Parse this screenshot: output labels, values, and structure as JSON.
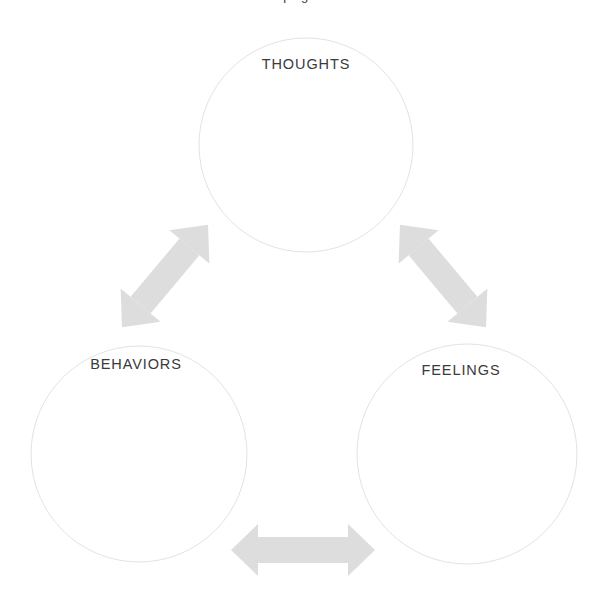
{
  "page": {
    "background_color": "#ffffff",
    "width": 610,
    "height": 605,
    "clipped_title": "Coping Skills"
  },
  "style": {
    "circle_stroke_color": "#e3e3e3",
    "circle_stroke_width": 1,
    "circle_fill": "#ffffff",
    "arrow_color": "#dddddd",
    "label_color": "#3a3a3a"
  },
  "diagram": {
    "type": "cycle-triangle",
    "nodes": [
      {
        "id": "thoughts",
        "label": "THOUGHTS",
        "cx": 306,
        "cy": 145,
        "r": 107,
        "label_x": 306,
        "label_y": 56
      },
      {
        "id": "behaviors",
        "label": "BEHAVIORS",
        "cx": 139,
        "cy": 454,
        "r": 108,
        "label_x": 136,
        "label_y": 356
      },
      {
        "id": "feelings",
        "label": "FEELINGS",
        "cx": 467,
        "cy": 454,
        "r": 110,
        "label_x": 461,
        "label_y": 362
      }
    ],
    "connectors": [
      {
        "id": "thoughts-behaviors",
        "from": "thoughts",
        "to": "behaviors",
        "style": "double-headed-arrow",
        "orientation": "diagonal-ne-sw"
      },
      {
        "id": "thoughts-feelings",
        "from": "thoughts",
        "to": "feelings",
        "style": "double-headed-arrow",
        "orientation": "diagonal-nw-se"
      },
      {
        "id": "behaviors-feelings",
        "from": "behaviors",
        "to": "feelings",
        "style": "double-headed-arrow",
        "orientation": "horizontal"
      }
    ]
  }
}
